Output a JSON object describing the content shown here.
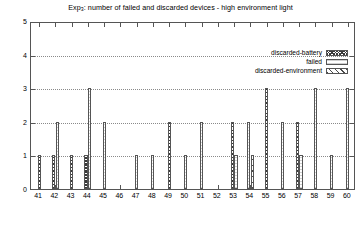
{
  "chart_data": {
    "type": "bar",
    "title": "Exp3: number of failed and discarded devices - high environment light",
    "title_prefix": "Exp",
    "title_sub": "3",
    "title_rest": ": number of failed and discarded devices - high environment light",
    "xlabel": "",
    "ylabel": "",
    "ylim": [
      0,
      5
    ],
    "grid": true,
    "grid_style": "dotted-horizontal",
    "legend_position": "top-right-inside",
    "yticks": [
      "0",
      "1",
      "2",
      "3",
      "4",
      "5"
    ],
    "categories": [
      "41",
      "42",
      "43",
      "44",
      "45",
      "46",
      "47",
      "48",
      "49",
      "50",
      "51",
      "52",
      "53",
      "54",
      "55",
      "56",
      "57",
      "58",
      "59",
      "60"
    ],
    "series": [
      {
        "name": "discarded-battery",
        "pattern": "cross-hatch",
        "values": [
          1,
          1,
          1,
          1,
          0,
          0,
          0,
          0,
          2,
          0,
          0,
          0,
          2,
          0,
          3,
          0,
          2,
          0,
          0,
          0
        ]
      },
      {
        "name": "failed",
        "pattern": "horizontal-lines",
        "values": [
          0,
          2,
          0,
          3,
          2,
          0,
          1,
          1,
          0,
          1,
          2,
          0,
          1,
          2,
          0,
          2,
          1,
          3,
          1,
          3
        ]
      },
      {
        "name": "discarded-environment",
        "pattern": "diagonal-hatch",
        "values": [
          0,
          0,
          0,
          0,
          0,
          0,
          0,
          0,
          0,
          0,
          0,
          0,
          0,
          1,
          0,
          0,
          0,
          0,
          0,
          0
        ]
      }
    ],
    "colors": {
      "axis": "#555555",
      "grid": "#8a8a8a",
      "bar_outline": "#555555",
      "background": "#ffffff"
    }
  }
}
